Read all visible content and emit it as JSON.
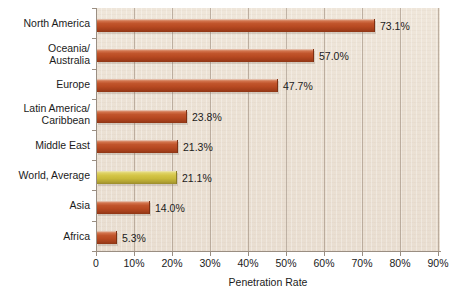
{
  "chart_data": {
    "type": "bar",
    "orientation": "horizontal",
    "title": "",
    "xlabel": "Penetration Rate",
    "ylabel": "",
    "xlim": [
      0,
      90
    ],
    "grid": true,
    "legend": false,
    "xticks": [
      "0",
      "10%",
      "20%",
      "30%",
      "40%",
      "50%",
      "60%",
      "70%",
      "80%",
      "90%"
    ],
    "xtick_values": [
      0,
      10,
      20,
      30,
      40,
      50,
      60,
      70,
      80,
      90
    ],
    "categories": [
      "North America",
      "Oceania/\nAustralia",
      "Europe",
      "Latin America/\nCaribbean",
      "Middle East",
      "World, Average",
      "Asia",
      "Africa"
    ],
    "values": [
      73.1,
      57.0,
      47.7,
      23.8,
      21.3,
      21.1,
      14.0,
      5.3
    ],
    "value_labels": [
      "73.1%",
      "57.0%",
      "47.7%",
      "23.8%",
      "21.3%",
      "21.1%",
      "14.0%",
      "5.3%"
    ],
    "bar_colors": [
      "#b84a22",
      "#b84a22",
      "#b84a22",
      "#b84a22",
      "#b84a22",
      "#c9ba3b",
      "#b84a22",
      "#b84a22"
    ],
    "highlight_category": "World, Average"
  },
  "colors": {
    "bar_brown": "#b84a22",
    "bar_yellow": "#c9ba3b",
    "plot_background": "#ebe1d4",
    "gridline": "#96847 3",
    "axis": "#9a8e82",
    "text": "#1b1b1b",
    "page_background": "#ffffff"
  },
  "axis": {
    "x_title": "Penetration Rate"
  }
}
